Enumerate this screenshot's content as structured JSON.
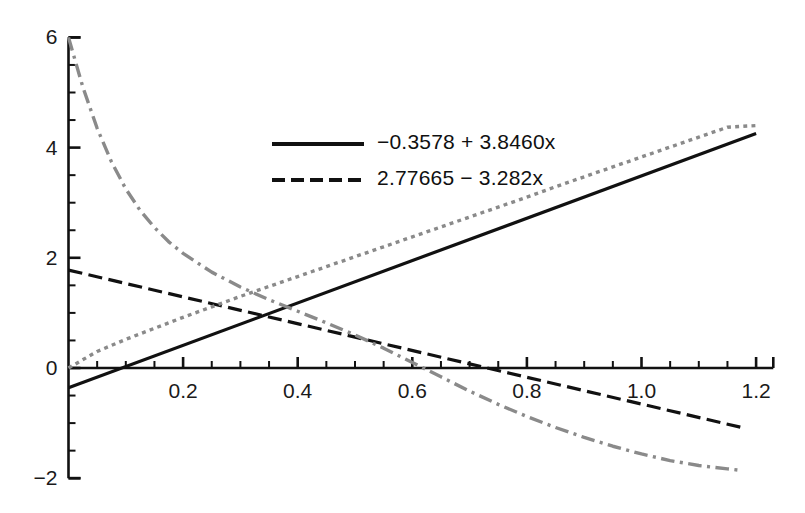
{
  "chart_data": {
    "type": "line",
    "title": "",
    "xlabel": "",
    "ylabel": "",
    "xlim": [
      -0.02,
      1.23
    ],
    "ylim": [
      -2,
      6
    ],
    "grid": false,
    "x_ticks_major": [
      0.2,
      0.4,
      0.6,
      0.8,
      1.0,
      1.2
    ],
    "x_tick_labels": [
      "0.2",
      "0.4",
      "0.6",
      "0.8",
      "1.0",
      "1.2"
    ],
    "x_ticks_minor_step": 0.05,
    "y_ticks_major": [
      -2,
      0,
      2,
      4,
      6
    ],
    "y_tick_labels": [
      "−2",
      "0",
      "2",
      "4",
      "6"
    ],
    "y_ticks_minor_step": 0.5,
    "legend_position": "upper-center-left",
    "series": [
      {
        "name": "solid-fit-line",
        "label": "−0.3578 + 3.8460x",
        "style": "solid",
        "color": "#111111",
        "width": 3.2,
        "equation": "y = -0.3578 + 3.8460*x",
        "points": [
          [
            0,
            -0.3578
          ],
          [
            1.2,
            4.2574
          ]
        ]
      },
      {
        "name": "dashed-fit-line",
        "label": "2.77665 − 3.282x",
        "style": "dashed",
        "color": "#111111",
        "width": 3.2,
        "equation": "y = 2.77665 - 3.282*x",
        "points": [
          [
            0,
            1.7767
          ],
          [
            1.175,
            -1.08
          ]
        ]
      },
      {
        "name": "gray-dotted-rising-curve",
        "label": "",
        "style": "dotted",
        "color": "#8a8a8a",
        "width": 3.4,
        "points": [
          [
            0.0,
            0.0
          ],
          [
            0.05,
            0.3
          ],
          [
            0.1,
            0.52
          ],
          [
            0.15,
            0.72
          ],
          [
            0.2,
            0.92
          ],
          [
            0.25,
            1.11
          ],
          [
            0.3,
            1.3
          ],
          [
            0.35,
            1.48
          ],
          [
            0.4,
            1.66
          ],
          [
            0.45,
            1.84
          ],
          [
            0.5,
            2.02
          ],
          [
            0.55,
            2.2
          ],
          [
            0.6,
            2.38
          ],
          [
            0.65,
            2.56
          ],
          [
            0.7,
            2.74
          ],
          [
            0.75,
            2.92
          ],
          [
            0.8,
            3.1
          ],
          [
            0.85,
            3.29
          ],
          [
            0.9,
            3.47
          ],
          [
            0.95,
            3.65
          ],
          [
            1.0,
            3.83
          ],
          [
            1.05,
            4.01
          ],
          [
            1.1,
            4.19
          ],
          [
            1.15,
            4.37
          ],
          [
            1.2,
            4.4
          ]
        ]
      },
      {
        "name": "gray-dashdot-decaying-curve",
        "label": "",
        "style": "dash-dot",
        "color": "#8a8a8a",
        "width": 3.4,
        "points": [
          [
            0.0,
            6.0
          ],
          [
            0.025,
            5.1
          ],
          [
            0.05,
            4.35
          ],
          [
            0.075,
            3.74
          ],
          [
            0.1,
            3.25
          ],
          [
            0.125,
            2.86
          ],
          [
            0.15,
            2.55
          ],
          [
            0.175,
            2.29
          ],
          [
            0.2,
            2.08
          ],
          [
            0.25,
            1.74
          ],
          [
            0.3,
            1.47
          ],
          [
            0.35,
            1.24
          ],
          [
            0.4,
            1.03
          ],
          [
            0.45,
            0.82
          ],
          [
            0.5,
            0.6
          ],
          [
            0.55,
            0.36
          ],
          [
            0.6,
            0.1
          ],
          [
            0.65,
            -0.16
          ],
          [
            0.7,
            -0.42
          ],
          [
            0.75,
            -0.66
          ],
          [
            0.8,
            -0.88
          ],
          [
            0.85,
            -1.08
          ],
          [
            0.9,
            -1.26
          ],
          [
            0.95,
            -1.42
          ],
          [
            1.0,
            -1.56
          ],
          [
            1.05,
            -1.68
          ],
          [
            1.1,
            -1.77
          ],
          [
            1.15,
            -1.83
          ],
          [
            1.175,
            -1.86
          ]
        ]
      }
    ],
    "legend_entries": [
      {
        "label": "−0.3578 + 3.8460x",
        "style": "solid",
        "color": "#111111"
      },
      {
        "label": "2.77665 − 3.282x",
        "style": "dashed",
        "color": "#111111"
      }
    ]
  },
  "axes": {
    "x_axis_name": "x-axis",
    "y_axis_name": "y-axis"
  }
}
